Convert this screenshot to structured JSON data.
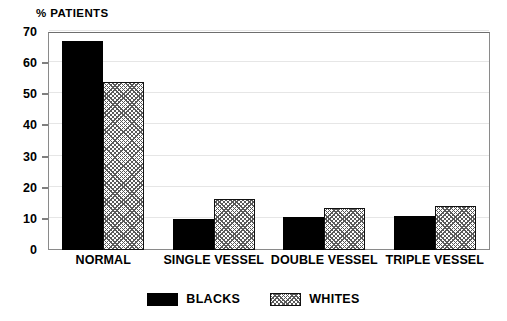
{
  "chart_data": {
    "type": "bar",
    "title": "",
    "ylabel": "% PATIENTS",
    "xlabel": "",
    "ylim": [
      0,
      70
    ],
    "yticks": [
      0,
      10,
      20,
      30,
      40,
      50,
      60,
      70
    ],
    "ytick_labels": [
      "0",
      "10",
      "20",
      "30",
      "40",
      "50",
      "60",
      "70"
    ],
    "grid": true,
    "legend_position": "bottom-center",
    "categories": [
      "NORMAL",
      "SINGLE VESSEL",
      "DOUBLE VESSEL",
      "TRIPLE VESSEL"
    ],
    "series": [
      {
        "name": "BLACKS",
        "color": "#000000",
        "fill": "solid",
        "values": [
          67,
          10,
          10.5,
          11
        ]
      },
      {
        "name": "WHITES",
        "color": "#ffffff",
        "fill": "hatched",
        "values": [
          54,
          16.5,
          13.5,
          14
        ]
      }
    ]
  },
  "legend": {
    "items": [
      {
        "label": "BLACKS",
        "swatch": "solid-black-swatch"
      },
      {
        "label": "WHITES",
        "swatch": "hatched-white-swatch"
      }
    ]
  }
}
